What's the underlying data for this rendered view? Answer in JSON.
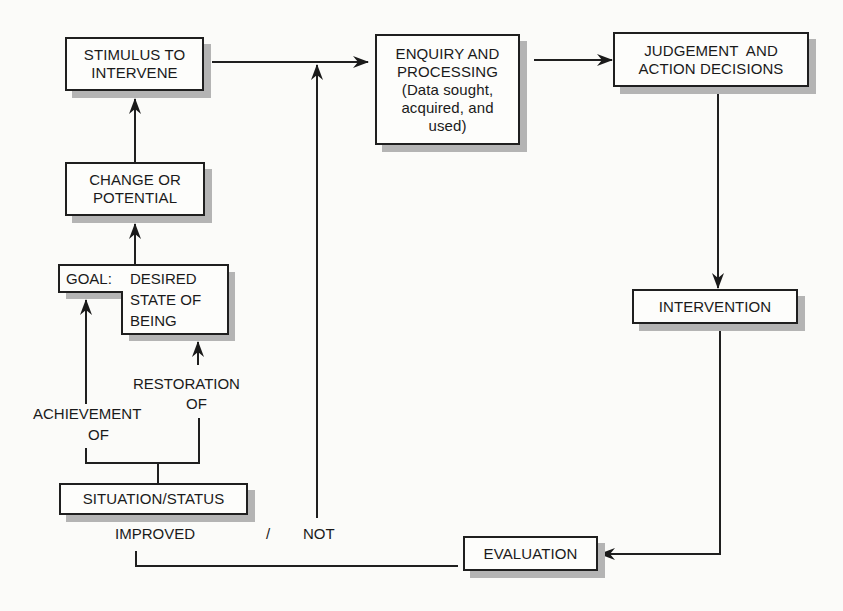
{
  "diagram": {
    "type": "flowchart",
    "nodes": {
      "stimulus": {
        "lines": [
          "STIMULUS TO",
          "INTERVENE"
        ]
      },
      "change": {
        "lines": [
          "CHANGE OR",
          "POTENTIAL"
        ]
      },
      "goal": {
        "prefix": "GOAL:",
        "lines": [
          "DESIRED",
          "STATE OF",
          "BEING"
        ]
      },
      "situation": {
        "lines": [
          "SITUATION/STATUS"
        ]
      },
      "enquiry": {
        "lines": [
          "ENQUIRY AND",
          "PROCESSING",
          "(Data sought,",
          "acquired, and",
          "used)"
        ]
      },
      "judgement": {
        "lines": [
          "JUDGEMENT  AND",
          "ACTION DECISIONS"
        ]
      },
      "intervention": {
        "lines": [
          "INTERVENTION"
        ]
      },
      "evaluation": {
        "lines": [
          "EVALUATION"
        ]
      }
    },
    "edge_labels": {
      "achievement": [
        "ACHIEVEMENT",
        "OF"
      ],
      "restoration": [
        "RESTORATION",
        "OF"
      ],
      "improved": "IMPROVED",
      "slash": "/",
      "not": "NOT"
    },
    "edges": [
      {
        "from": "situation",
        "to": "goal",
        "label": "ACHIEVEMENT OF"
      },
      {
        "from": "situation",
        "to": "goal",
        "label": "RESTORATION OF"
      },
      {
        "from": "goal",
        "to": "change"
      },
      {
        "from": "change",
        "to": "stimulus"
      },
      {
        "from": "stimulus",
        "to": "enquiry"
      },
      {
        "from": "enquiry",
        "to": "judgement"
      },
      {
        "from": "judgement",
        "to": "intervention"
      },
      {
        "from": "intervention",
        "to": "evaluation"
      },
      {
        "from": "evaluation",
        "to": "situation",
        "label": "IMPROVED"
      },
      {
        "from": "evaluation",
        "to": "enquiry",
        "label": "NOT"
      }
    ]
  }
}
